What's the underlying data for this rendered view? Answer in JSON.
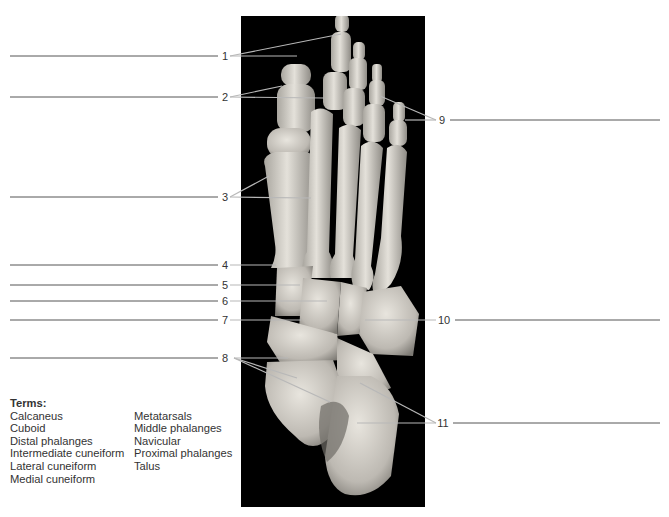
{
  "figure": {
    "labels": [
      {
        "number": "1",
        "side": "left",
        "y": 56
      },
      {
        "number": "2",
        "side": "left",
        "y": 97
      },
      {
        "number": "3",
        "side": "left",
        "y": 197
      },
      {
        "number": "4",
        "side": "left",
        "y": 265
      },
      {
        "number": "5",
        "side": "left",
        "y": 285
      },
      {
        "number": "6",
        "side": "left",
        "y": 301
      },
      {
        "number": "7",
        "side": "left",
        "y": 320
      },
      {
        "number": "8",
        "side": "left",
        "y": 358
      },
      {
        "number": "9",
        "side": "right",
        "y": 120
      },
      {
        "number": "10",
        "side": "right",
        "y": 320
      },
      {
        "number": "11",
        "side": "right",
        "y": 423
      }
    ],
    "answer_blanks": [
      {
        "for": "1",
        "value": ""
      },
      {
        "for": "2",
        "value": ""
      },
      {
        "for": "3",
        "value": ""
      },
      {
        "for": "4",
        "value": ""
      },
      {
        "for": "5",
        "value": ""
      },
      {
        "for": "6",
        "value": ""
      },
      {
        "for": "7",
        "value": ""
      },
      {
        "for": "8",
        "value": ""
      },
      {
        "for": "9",
        "value": ""
      },
      {
        "for": "10",
        "value": ""
      },
      {
        "for": "11",
        "value": ""
      }
    ]
  },
  "terms": {
    "title": "Terms:",
    "column1": [
      "Calcaneus",
      "Cuboid",
      "Distal phalanges",
      "Intermediate cuneiform",
      "Lateral cuneiform",
      "Medial cuneiform"
    ],
    "column2": [
      "Metatarsals",
      "Middle phalanges",
      "Navicular",
      "Proximal phalanges",
      "Talus"
    ]
  },
  "colors": {
    "background": "#ffffff",
    "photo_background": "#000000",
    "bone": "#d9d6cf",
    "bone_shadow": "#8e8b85",
    "leader_line": "#b8b8b8",
    "answer_line": "#555555",
    "text": "#333333"
  }
}
